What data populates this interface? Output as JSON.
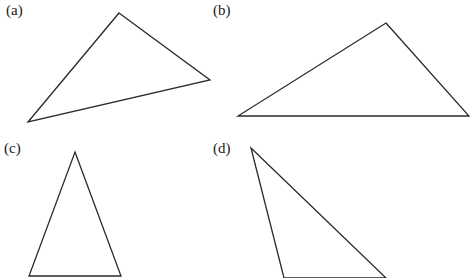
{
  "figure": {
    "panels": [
      {
        "id": "a",
        "label": "(a)",
        "label_pos": [
          6,
          3
        ],
        "shape": "triangle",
        "vertices": [
          [
            119,
            13
          ],
          [
            210,
            80
          ],
          [
            28,
            122
          ]
        ]
      },
      {
        "id": "b",
        "label": "(b)",
        "label_pos": [
          213,
          3
        ],
        "shape": "triangle",
        "vertices": [
          [
            386,
            23
          ],
          [
            469,
            116
          ],
          [
            238,
            116
          ]
        ]
      },
      {
        "id": "c",
        "label": "(c)",
        "label_pos": [
          4,
          141
        ],
        "shape": "triangle",
        "vertices": [
          [
            75,
            152
          ],
          [
            121,
            276
          ],
          [
            29,
            276
          ]
        ]
      },
      {
        "id": "d",
        "label": "(d)",
        "label_pos": [
          213,
          141
        ],
        "shape": "triangle",
        "vertices": [
          [
            251,
            148
          ],
          [
            386,
            278
          ],
          [
            284,
            278
          ]
        ]
      }
    ],
    "stroke_color": "#2a2a2a",
    "background_color": "#ffffff"
  }
}
